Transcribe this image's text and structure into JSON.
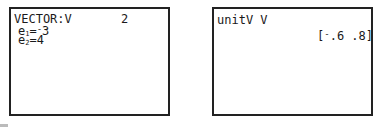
{
  "left_screen": {
    "header_label": "VECTOR:V",
    "dimension": "2",
    "entries": [
      {
        "name": "e",
        "index": "1",
        "eq": "=",
        "sign": "-",
        "value": "3"
      },
      {
        "name": "e",
        "index": "2",
        "eq": "=",
        "sign": "",
        "value": "4"
      }
    ]
  },
  "right_screen": {
    "command": "unitV V",
    "result_open": "[",
    "result_sign": "-",
    "result_body": ".6 .8]"
  }
}
